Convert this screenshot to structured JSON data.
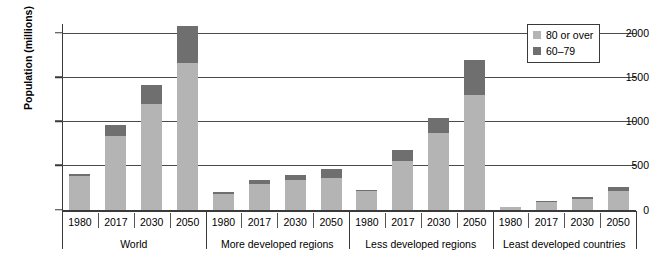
{
  "chart_data": {
    "type": "bar",
    "title": "",
    "xlabel": "",
    "ylabel": "Population (millions)",
    "ylim": [
      0,
      2100
    ],
    "yticks": [
      0,
      500,
      1000,
      1500,
      2000
    ],
    "ytick_labels": [
      "0",
      "500",
      "1000",
      "1500",
      "2000"
    ],
    "grid": true,
    "stacked": true,
    "legend_position": "top-right",
    "legend": [
      {
        "label": "80 or over",
        "color": "#b4b4b4"
      },
      {
        "label": "60–79",
        "color": "#6f6f6f"
      }
    ],
    "series": [
      {
        "name": "80 or over",
        "color": "#b4b4b4",
        "values": [
          380,
          830,
          1190,
          1660,
          180,
          290,
          330,
          360,
          205,
          545,
          865,
          1300,
          25,
          80,
          120,
          215
        ]
      },
      {
        "name": "60–79",
        "color": "#6f6f6f",
        "values": [
          25,
          130,
          220,
          420,
          20,
          45,
          60,
          100,
          20,
          125,
          175,
          390,
          5,
          15,
          25,
          45
        ]
      }
    ],
    "categories": [
      "1980",
      "2017",
      "2030",
      "2050",
      "1980",
      "2017",
      "2030",
      "2050",
      "1980",
      "2017",
      "2030",
      "2050",
      "1980",
      "2017",
      "2030",
      "2050"
    ],
    "groups": [
      {
        "label": "World",
        "categories": [
          "1980",
          "2017",
          "2030",
          "2050"
        ],
        "bars": [
          {
            "year": "1980",
            "80_or_over": 380,
            "60_79": 25,
            "total": 405
          },
          {
            "year": "2017",
            "80_or_over": 830,
            "60_79": 130,
            "total": 960
          },
          {
            "year": "2030",
            "80_or_over": 1190,
            "60_79": 220,
            "total": 1410
          },
          {
            "year": "2050",
            "80_or_over": 1660,
            "60_79": 420,
            "total": 2080
          }
        ]
      },
      {
        "label": "More developed regions",
        "categories": [
          "1980",
          "2017",
          "2030",
          "2050"
        ],
        "bars": [
          {
            "year": "1980",
            "80_or_over": 180,
            "60_79": 20,
            "total": 200
          },
          {
            "year": "2017",
            "80_or_over": 290,
            "60_79": 45,
            "total": 335
          },
          {
            "year": "2030",
            "80_or_over": 330,
            "60_79": 60,
            "total": 390
          },
          {
            "year": "2050",
            "80_or_over": 360,
            "60_79": 100,
            "total": 460
          }
        ]
      },
      {
        "label": "Less developed regions",
        "categories": [
          "1980",
          "2017",
          "2030",
          "2050"
        ],
        "bars": [
          {
            "year": "1980",
            "80_or_over": 205,
            "60_79": 20,
            "total": 225
          },
          {
            "year": "2017",
            "80_or_over": 545,
            "60_79": 125,
            "total": 670
          },
          {
            "year": "2030",
            "80_or_over": 865,
            "60_79": 175,
            "total": 1040
          },
          {
            "year": "2050",
            "80_or_over": 1300,
            "60_79": 390,
            "total": 1690
          }
        ]
      },
      {
        "label": "Least developed countries",
        "categories": [
          "1980",
          "2017",
          "2030",
          "2050"
        ],
        "bars": [
          {
            "year": "1980",
            "80_or_over": 25,
            "60_79": 5,
            "total": 30
          },
          {
            "year": "2017",
            "80_or_over": 80,
            "60_79": 15,
            "total": 95
          },
          {
            "year": "2030",
            "80_or_over": 120,
            "60_79": 25,
            "total": 145
          },
          {
            "year": "2050",
            "80_or_over": 215,
            "60_79": 45,
            "total": 260
          }
        ]
      }
    ]
  },
  "colors": {
    "light_gray": "#b4b4b4",
    "dark_gray": "#6f6f6f",
    "axis": "#3a3a3a",
    "background": "#ffffff"
  }
}
